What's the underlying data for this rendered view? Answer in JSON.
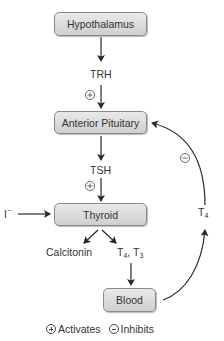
{
  "nodes": {
    "hypothalamus": "Hypothalamus",
    "anterior_pituitary": "Anterior Pituitary",
    "thyroid": "Thyroid",
    "blood": "Blood"
  },
  "hormones": {
    "trh": "TRH",
    "tsh": "TSH",
    "iodide": "I",
    "iodide_charge": "−",
    "calcitonin": "Calcitonin",
    "t4_t3_part1": "T",
    "t4_sub": "4",
    "t4_t3_sep": ", T",
    "t3_sub": "3",
    "feedback_t": "T",
    "feedback_sub": "4"
  },
  "effects": {
    "trh_effect": "activates",
    "tsh_effect": "activates",
    "t4_feedback_effect": "inhibits"
  },
  "legend": {
    "activates_label": "Activates",
    "inhibits_label": "Inhibits"
  },
  "colors": {
    "box_fill_top": "#e9e9e9",
    "box_fill_bottom": "#cfcfcf",
    "line": "#2a2a2a"
  }
}
